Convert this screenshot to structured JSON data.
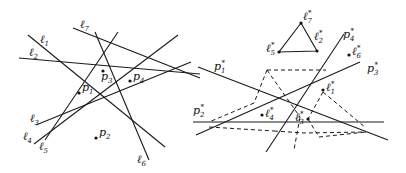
{
  "left_panel": {
    "lines": [
      {
        "label": "ℓ",
        "sub": "1",
        "x1": 28,
        "y1": 35,
        "x2": 165,
        "y2": 147,
        "lx": 40,
        "ly": 43
      },
      {
        "label": "ℓ",
        "sub": "2",
        "x1": 19,
        "y1": 58,
        "x2": 200,
        "y2": 74,
        "lx": 29,
        "ly": 56
      },
      {
        "label": "ℓ",
        "sub": "3",
        "x1": 36,
        "y1": 125,
        "x2": 191,
        "y2": 62,
        "lx": 30,
        "ly": 122
      },
      {
        "label": "ℓ",
        "sub": "4",
        "x1": 34,
        "y1": 144,
        "x2": 178,
        "y2": 35,
        "lx": 23,
        "ly": 140
      },
      {
        "label": "ℓ",
        "sub": "5",
        "x1": 45,
        "y1": 140,
        "x2": 118,
        "y2": 32,
        "lx": 39,
        "ly": 150
      },
      {
        "label": "ℓ",
        "sub": "6",
        "x1": 95,
        "y1": 32,
        "x2": 149,
        "y2": 160,
        "lx": 137,
        "ly": 163
      },
      {
        "label": "ℓ",
        "sub": "7",
        "x1": 73,
        "y1": 28,
        "x2": 200,
        "y2": 78,
        "lx": 80,
        "ly": 28
      }
    ],
    "points": [
      {
        "label": "p",
        "sub": "1",
        "x": 79,
        "y": 93,
        "lx": 82,
        "ly": 91
      },
      {
        "label": "p",
        "sub": "2",
        "x": 96,
        "y": 138,
        "lx": 99,
        "ly": 136
      },
      {
        "label": "p",
        "sub": "3",
        "x": 103,
        "y": 71,
        "lx": 101,
        "ly": 80
      },
      {
        "label": "p",
        "sub": "4",
        "x": 130,
        "y": 81,
        "lx": 133,
        "ly": 80
      }
    ]
  },
  "right_panel": {
    "lines": [
      {
        "label": "p*",
        "sub": "1",
        "x1": 198,
        "y1": 67,
        "x2": 388,
        "y2": 140,
        "lx": 214,
        "ly": 70
      },
      {
        "label": "p*",
        "sub": "2",
        "x1": 193,
        "y1": 122,
        "x2": 384,
        "y2": 122,
        "lx": 193,
        "ly": 114
      },
      {
        "label": "p*",
        "sub": "3",
        "x1": 196,
        "y1": 135,
        "x2": 360,
        "y2": 62,
        "lx": 367,
        "ly": 72
      },
      {
        "label": "p*",
        "sub": "4",
        "x1": 266,
        "y1": 152,
        "x2": 344,
        "y2": 34,
        "lx": 343,
        "ly": 38
      }
    ],
    "points": [
      {
        "label": "ℓ*",
        "sub": "1",
        "x": 323,
        "y": 90,
        "lx": 326,
        "ly": 91
      },
      {
        "label": "ℓ*",
        "sub": "3",
        "x": 308,
        "y": 119,
        "lx": 295,
        "ly": 121
      },
      {
        "label": "ℓ*",
        "sub": "4",
        "x": 262,
        "y": 115,
        "lx": 265,
        "ly": 117
      },
      {
        "label": "ℓ*",
        "sub": "6",
        "x": 349,
        "y": 55,
        "lx": 352,
        "ly": 55
      }
    ],
    "triangle": {
      "vertices": [
        {
          "label": "ℓ*",
          "sub": "7",
          "x": 301,
          "y": 23,
          "lx": 303,
          "ly": 20
        },
        {
          "label": "ℓ*",
          "sub": "5",
          "x": 279,
          "y": 52,
          "lx": 266,
          "ly": 52
        },
        {
          "label": "ℓ*",
          "sub": "2",
          "x": 317,
          "y": 51,
          "lx": 314,
          "ly": 40
        }
      ]
    },
    "dashed_paths": [
      "M 267 70 L 326 70",
      "M 267 70 L 254 103",
      "M 254 103 L 209 122",
      "M 267 70 L 300 117",
      "M 300 117 L 294 150",
      "M 323 92 L 366 128",
      "M 323 92 L 308 119",
      "M 308 119 L 319 137",
      "M 209 127 L 274 131",
      "M 274 131 L 304 133 L 366 132",
      "M 319 137 L 366 132"
    ]
  }
}
